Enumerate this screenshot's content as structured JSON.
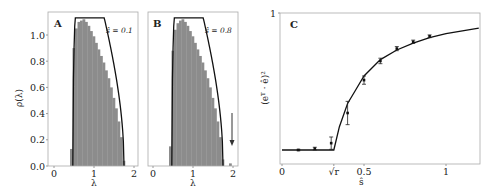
{
  "chart_data": [
    {
      "panel": "A",
      "type": "bar",
      "title": "",
      "annotation": "ŝ = 0.1",
      "xlabel": "λ",
      "ylabel": "ρ(λ)",
      "xlim": [
        -0.15,
        2.1
      ],
      "ylim": [
        0,
        1.18
      ],
      "xticks": [
        0,
        1,
        2
      ],
      "yticks": [
        "0.0",
        "0.2",
        "0.4",
        "0.6",
        "0.8",
        "1.0"
      ],
      "histogram": {
        "bin_width": 0.0625,
        "bins_left": [
          0.4,
          0.4625,
          0.525,
          0.5875,
          0.65,
          0.7125,
          0.775,
          0.8375,
          0.9,
          0.9625,
          1.025,
          1.0875,
          1.15,
          1.2125,
          1.275,
          1.3375,
          1.4,
          1.4625,
          1.525,
          1.5875,
          1.65,
          1.7125
        ],
        "heights": [
          0.13,
          0.9,
          1.05,
          1.1,
          1.11,
          1.12,
          1.1,
          1.07,
          1.03,
          0.99,
          0.94,
          0.89,
          0.84,
          0.79,
          0.73,
          0.67,
          0.6,
          0.52,
          0.44,
          0.34,
          0.22,
          0.04
        ]
      },
      "curve": {
        "support": [
          0.47,
          1.75
        ],
        "peak_x": 0.72,
        "peak_y": 1.12
      },
      "grid": false
    },
    {
      "panel": "B",
      "type": "bar",
      "title": "",
      "annotation": "ŝ = 0.8",
      "xlabel": "λ",
      "ylabel": "",
      "xlim": [
        -0.15,
        2.1
      ],
      "ylim": [
        0,
        1.18
      ],
      "xticks": [
        0,
        1,
        2
      ],
      "histogram": {
        "bin_width": 0.0625,
        "bins_left": [
          0.4,
          0.4625,
          0.525,
          0.5875,
          0.65,
          0.7125,
          0.775,
          0.8375,
          0.9,
          0.9625,
          1.025,
          1.0875,
          1.15,
          1.2125,
          1.275,
          1.3375,
          1.4,
          1.4625,
          1.525,
          1.5875,
          1.65,
          1.7125,
          1.9
        ],
        "heights": [
          0.15,
          0.88,
          1.04,
          1.09,
          1.11,
          1.12,
          1.1,
          1.07,
          1.03,
          0.99,
          0.94,
          0.89,
          0.84,
          0.79,
          0.73,
          0.67,
          0.6,
          0.52,
          0.44,
          0.34,
          0.22,
          0.05,
          0.02
        ]
      },
      "curve": {
        "support": [
          0.47,
          1.75
        ],
        "peak_x": 0.72,
        "peak_y": 1.12
      },
      "arrow": {
        "x": 1.97,
        "y_from": 0.41,
        "y_to": 0.16,
        "note": "points to outlier eigenvalue"
      },
      "grid": false
    },
    {
      "panel": "C",
      "type": "line",
      "title": "",
      "xlabel": "ŝ",
      "ylabel": "(e^T · ê)^2",
      "xlim": [
        -0.02,
        1.2
      ],
      "ylim": [
        -0.08,
        1.0
      ],
      "xticks": [
        {
          "v": 0,
          "label": "0"
        },
        {
          "v": 0.316,
          "label": "√r"
        },
        {
          "v": 0.5,
          "label": "0.5"
        },
        {
          "v": 1,
          "label": "1"
        }
      ],
      "yticks": [
        {
          "v": 1,
          "label": "1"
        }
      ],
      "threshold_sqrt_r": 0.316,
      "series": [
        {
          "name": "theory",
          "x": [
            0,
            0.1,
            0.2,
            0.316,
            0.35,
            0.4,
            0.45,
            0.5,
            0.6,
            0.7,
            0.8,
            0.9,
            1.0,
            1.1,
            1.2
          ],
          "values": [
            0,
            0,
            0,
            0,
            0.17,
            0.34,
            0.44,
            0.54,
            0.66,
            0.73,
            0.78,
            0.82,
            0.85,
            0.87,
            0.89
          ]
        },
        {
          "name": "simulation",
          "x": [
            0.1,
            0.2,
            0.3,
            0.4,
            0.5,
            0.6,
            0.7,
            0.8,
            0.9
          ],
          "values": [
            0.0,
            0.01,
            0.05,
            0.27,
            0.51,
            0.65,
            0.74,
            0.79,
            0.83
          ],
          "errors": [
            0.005,
            0.01,
            0.045,
            0.085,
            0.03,
            0.02,
            0.015,
            0.012,
            0.01
          ]
        }
      ],
      "grid": false
    }
  ],
  "labels": {
    "panel_a": "A",
    "panel_b": "B",
    "panel_c": "C",
    "annot_a": "ŝ = 0.1",
    "annot_b": "ŝ = 0.8",
    "xlabel_ab": "λ",
    "ylabel_a": "ρ(λ)",
    "xlabel_c": "ŝ",
    "ylabel_c": "(eᵀ · ê)²"
  },
  "colors": {
    "bar_fill": "#8c8c8c",
    "curve": "#111111",
    "axis": "#9a9a9a",
    "text": "#222222"
  }
}
